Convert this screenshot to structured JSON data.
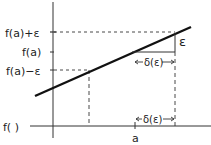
{
  "diagram": {
    "y_labels": {
      "upper": "f(a)+ε",
      "middle": "f(a)",
      "lower": "f(a)−ε"
    },
    "x_axis_label": "f( )",
    "x_tick_label": "a",
    "epsilon_label": "ε",
    "delta_upper": "δ(ε)",
    "delta_lower": "δ(ε)",
    "colors": {
      "ink": "#222222",
      "background": "#ffffff"
    }
  }
}
